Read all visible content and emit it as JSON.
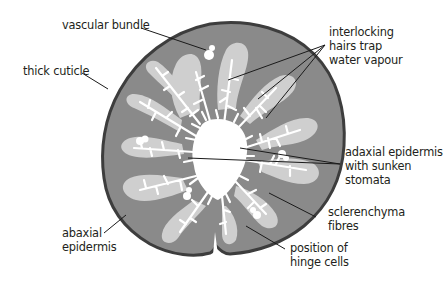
{
  "diagram": {
    "colors": {
      "cuticle": "#3d3d3d",
      "mesophyll": "#8a8a8a",
      "sclerenchyma": "#cfcfcf",
      "hairs_and_cavity": "#ffffff",
      "leader_line": "#1a1a1a",
      "text": "#231f20"
    },
    "labels": {
      "vascular_bundle": {
        "lines": [
          "vascular bundle"
        ]
      },
      "thick_cuticle": {
        "lines": [
          "thick cuticle"
        ]
      },
      "interlocking_hairs": {
        "lines": [
          "interlocking",
          "hairs trap",
          "water vapour"
        ]
      },
      "adaxial_epidermis": {
        "lines": [
          "adaxial epidermis",
          "with sunken",
          "stomata"
        ]
      },
      "sclerenchyma": {
        "lines": [
          "sclerenchyma",
          "fibres"
        ]
      },
      "abaxial_epidermis": {
        "lines": [
          "abaxial",
          "epidermis"
        ]
      },
      "hinge_cells": {
        "lines": [
          "position of",
          "hinge cells"
        ]
      }
    }
  }
}
